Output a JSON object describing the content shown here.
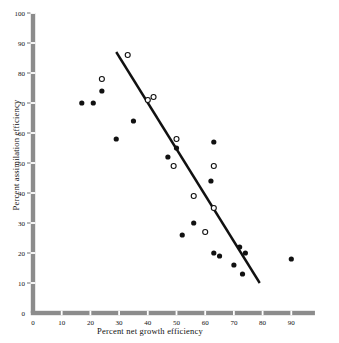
{
  "chart_data": {
    "type": "scatter",
    "title": "",
    "xlabel": "Percent net growth efficiency",
    "ylabel": "Percent assimilation efficiency",
    "xlim": [
      0,
      100
    ],
    "ylim": [
      0,
      100
    ],
    "xticks": [
      0,
      10,
      20,
      30,
      40,
      50,
      60,
      70,
      80,
      90
    ],
    "yticks": [
      0,
      10,
      20,
      30,
      40,
      50,
      60,
      70,
      80,
      90,
      100
    ],
    "grid": false,
    "legend": null,
    "series": [
      {
        "name": "filled-markers",
        "marker": "filled-circle",
        "color": "#111111",
        "points": [
          [
            17,
            70
          ],
          [
            21,
            70
          ],
          [
            24,
            74
          ],
          [
            29,
            58
          ],
          [
            35,
            64
          ],
          [
            47,
            52
          ],
          [
            50,
            55
          ],
          [
            52,
            26
          ],
          [
            56,
            30
          ],
          [
            62,
            44
          ],
          [
            63,
            57
          ],
          [
            63,
            20
          ],
          [
            65,
            19
          ],
          [
            70,
            16
          ],
          [
            72,
            22
          ],
          [
            73,
            13
          ],
          [
            74,
            20
          ],
          [
            90,
            18
          ]
        ]
      },
      {
        "name": "open-markers",
        "marker": "open-circle",
        "color": "#111111",
        "points": [
          [
            24,
            78
          ],
          [
            33,
            86
          ],
          [
            40,
            71
          ],
          [
            42,
            72
          ],
          [
            49,
            49
          ],
          [
            50,
            58
          ],
          [
            56,
            39
          ],
          [
            60,
            27
          ],
          [
            63,
            49
          ],
          [
            63,
            35
          ]
        ]
      }
    ],
    "trendline": {
      "name": "regression-line",
      "color": "#111111",
      "x0": 29,
      "y0": 87,
      "x1": 79,
      "y1": 10
    }
  },
  "axis": {
    "x_tick_labels": [
      "0",
      "10",
      "20",
      "30",
      "40",
      "50",
      "60",
      "70",
      "80",
      "90"
    ],
    "y_tick_labels": [
      "0",
      "10",
      "20",
      "30",
      "40",
      "50",
      "60",
      "70",
      "80",
      "90",
      "100"
    ],
    "x_title": "Percent net growth efficiency",
    "y_title": "Percent assimilation efficiency"
  }
}
